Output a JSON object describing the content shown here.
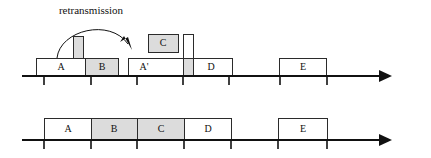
{
  "figure": {
    "title": "",
    "annotation": {
      "text": "retransmission",
      "x": 91,
      "y": 11
    },
    "axis_label": "time",
    "rows": [
      {
        "name": "sender-timeline",
        "axis_y": 76,
        "axis_x_start": 22,
        "axis_x_end": 392,
        "time_label_x": 396,
        "ticks": [
          44,
          91,
          137,
          183,
          229,
          280,
          327
        ],
        "blocks": [
          {
            "label": "A",
            "x": 36,
            "y": 58,
            "w": 49,
            "h": 18,
            "fill": "white",
            "label_visible": true
          },
          {
            "label": "B",
            "x": 85,
            "y": 58,
            "w": 33,
            "h": 18,
            "fill": "shaded",
            "label_visible": true
          },
          {
            "label": "",
            "x": 73,
            "y": 36,
            "w": 10,
            "h": 22,
            "fill": "shaded",
            "label_visible": false
          },
          {
            "label": "A'",
            "x": 128,
            "y": 58,
            "w": 55,
            "h": 18,
            "fill": "white",
            "label_visible": true
          },
          {
            "label": "",
            "x": 183,
            "y": 58,
            "w": 10,
            "h": 18,
            "fill": "shaded",
            "label_visible": false
          },
          {
            "label": "D",
            "x": 193,
            "y": 58,
            "w": 39,
            "h": 18,
            "fill": "white",
            "label_visible": true
          },
          {
            "label": "C",
            "x": 148,
            "y": 34,
            "w": 30,
            "h": 18,
            "fill": "shaded",
            "label_visible": true
          },
          {
            "label": "",
            "x": 183,
            "y": 34,
            "w": 10,
            "h": 24,
            "fill": "white",
            "label_visible": false
          },
          {
            "label": "E",
            "x": 279,
            "y": 58,
            "w": 47,
            "h": 18,
            "fill": "white",
            "label_visible": true
          }
        ]
      },
      {
        "name": "receiver-timeline",
        "axis_y": 140,
        "axis_x_start": 22,
        "axis_x_end": 392,
        "time_label_x": 396,
        "ticks": [
          44,
          91,
          137,
          184,
          231,
          278,
          327
        ],
        "blocks": [
          {
            "label": "A",
            "x": 44,
            "y": 118,
            "w": 47,
            "h": 22,
            "fill": "white",
            "label_visible": true
          },
          {
            "label": "B",
            "x": 91,
            "y": 118,
            "w": 46,
            "h": 22,
            "fill": "shaded",
            "label_visible": true
          },
          {
            "label": "C",
            "x": 137,
            "y": 118,
            "w": 47,
            "h": 22,
            "fill": "shaded",
            "label_visible": true
          },
          {
            "label": "D",
            "x": 184,
            "y": 118,
            "w": 47,
            "h": 22,
            "fill": "white",
            "label_visible": true
          },
          {
            "label": "E",
            "x": 278,
            "y": 118,
            "w": 49,
            "h": 22,
            "fill": "white",
            "label_visible": true
          }
        ]
      }
    ]
  }
}
